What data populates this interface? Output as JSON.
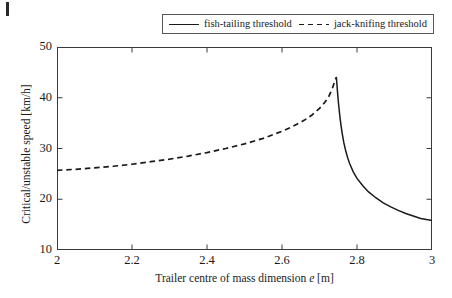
{
  "chart_data": {
    "type": "line",
    "title": "",
    "xlabel": "Trailer centre of mass dimension e [m]",
    "xlabel_parts": {
      "pre": "Trailer centre of mass dimension ",
      "symbol": "e",
      "post": " [m]"
    },
    "ylabel": "Critical/unstable speed [km/h]",
    "xlim": [
      2,
      3
    ],
    "ylim": [
      10,
      50
    ],
    "xticks": [
      "2",
      "2.2",
      "2.4",
      "2.6",
      "2.8",
      "3"
    ],
    "xtick_values": [
      2,
      2.2,
      2.4,
      2.6,
      2.8,
      3
    ],
    "yticks": [
      "10",
      "20",
      "30",
      "40",
      "50"
    ],
    "ytick_values": [
      10,
      20,
      30,
      40,
      50
    ],
    "grid": false,
    "legend_position": "top-center-outside",
    "series": [
      {
        "name": "jack-knifing threshold",
        "style": "dashed",
        "color": "#1a1a1a",
        "x": [
          2.0,
          2.05,
          2.1,
          2.15,
          2.2,
          2.25,
          2.3,
          2.35,
          2.4,
          2.45,
          2.5,
          2.55,
          2.6,
          2.63,
          2.66,
          2.68,
          2.7,
          2.71,
          2.72,
          2.725,
          2.73,
          2.735,
          2.74,
          2.7425,
          2.745
        ],
        "values": [
          25.7,
          25.9,
          26.2,
          26.5,
          26.9,
          27.4,
          27.9,
          28.5,
          29.2,
          30.0,
          30.9,
          32.0,
          33.4,
          34.4,
          35.6,
          36.6,
          37.9,
          38.7,
          39.7,
          40.3,
          41.1,
          42.0,
          43.1,
          43.6,
          44.0
        ]
      },
      {
        "name": "fish-tailing threshold",
        "style": "solid",
        "color": "#1a1a1a",
        "x": [
          2.745,
          2.7465,
          2.748,
          2.75,
          2.753,
          2.756,
          2.76,
          2.765,
          2.77,
          2.775,
          2.78,
          2.79,
          2.8,
          2.815,
          2.83,
          2.85,
          2.87,
          2.89,
          2.91,
          2.93,
          2.95,
          2.97,
          3.0
        ],
        "values": [
          44.0,
          42.6,
          41.2,
          39.4,
          37.2,
          35.3,
          33.2,
          31.1,
          29.5,
          28.2,
          27.1,
          25.4,
          24.1,
          22.7,
          21.5,
          20.3,
          19.3,
          18.5,
          17.8,
          17.2,
          16.7,
          16.2,
          15.8
        ]
      }
    ],
    "annotations": {
      "peak_x": 2.745,
      "peak_y": 44.0
    }
  },
  "legend": {
    "entries": [
      {
        "label": "fish-tailing threshold",
        "style": "solid"
      },
      {
        "label": "jack-knifing threshold",
        "style": "dashed"
      }
    ]
  }
}
